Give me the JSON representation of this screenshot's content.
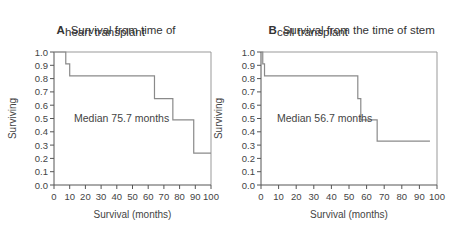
{
  "chart_data": [
    {
      "type": "line",
      "panel": "A",
      "title": "Survival from time of heart transplant",
      "title_lines": [
        "Survival from time of",
        "heart transplant"
      ],
      "xlabel": "Survival (months)",
      "ylabel": "Surviving",
      "xlim": [
        0,
        100
      ],
      "ylim": [
        0.0,
        1.0
      ],
      "xticks": [
        0,
        10,
        20,
        30,
        40,
        50,
        60,
        70,
        80,
        90,
        100
      ],
      "yticks": [
        "0.0",
        "0.1",
        "0.2",
        "0.3",
        "0.4",
        "0.5",
        "0.6",
        "0.7",
        "0.8",
        "0.9",
        "1.0"
      ],
      "grid": false,
      "step": true,
      "annotation": "Median 75.7 months",
      "series": [
        {
          "name": "Kaplan-Meier survival",
          "x": [
            0,
            7.5,
            10,
            64,
            75.7,
            89,
            100
          ],
          "y": [
            1.0,
            0.91,
            0.82,
            0.65,
            0.49,
            0.24,
            0.24
          ]
        }
      ]
    },
    {
      "type": "line",
      "panel": "B",
      "title": "Survival from the time of stem cell transplant",
      "title_lines": [
        "Survival from the time of stem",
        "cell transplant"
      ],
      "xlabel": "Survival (months)",
      "ylabel": "Surviving",
      "xlim": [
        0,
        100
      ],
      "ylim": [
        0.0,
        1.0
      ],
      "xticks": [
        0,
        10,
        20,
        30,
        40,
        50,
        60,
        70,
        80,
        90,
        100
      ],
      "yticks": [
        "0.0",
        "0.1",
        "0.2",
        "0.3",
        "0.4",
        "0.5",
        "0.6",
        "0.7",
        "0.8",
        "0.9",
        "1.0"
      ],
      "grid": false,
      "step": true,
      "annotation": "Median 56.7 months",
      "series": [
        {
          "name": "Kaplan-Meier survival",
          "x": [
            0,
            1,
            2,
            55,
            56.7,
            66,
            96
          ],
          "y": [
            1.0,
            0.91,
            0.82,
            0.65,
            0.49,
            0.33,
            0.33
          ]
        }
      ]
    }
  ],
  "panels": {
    "a": {
      "letter": "A",
      "line1": "Survival from time of",
      "line2": "heart transplant",
      "median": "Median 75.7 months",
      "xlabel": "Survival (months)",
      "ylabel": "Surviving"
    },
    "b": {
      "letter": "B",
      "line1": "Survival from the time of stem",
      "line2": "cell transplant",
      "median": "Median 56.7 months",
      "xlabel": "Survival (months)",
      "ylabel": "Surviving"
    }
  },
  "colors": {
    "axis": "#555555",
    "curve": "#8a8a8a",
    "text": "#333333"
  }
}
